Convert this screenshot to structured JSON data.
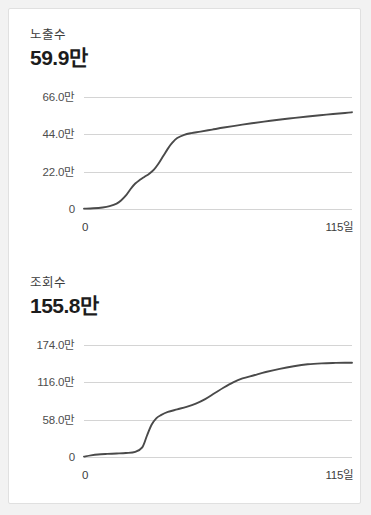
{
  "page": {
    "background_color": "#f2f2f2",
    "card_background": "#ffffff",
    "card_border_color": "#e0e0e0"
  },
  "panels": [
    {
      "metric_label": "노출수",
      "metric_value": "59.9만"
    },
    {
      "metric_label": "조회수",
      "metric_value": "155.8만"
    }
  ],
  "chart_data": [
    {
      "type": "line",
      "title": "노출수",
      "total_label": "59.9만",
      "xlabel": "",
      "ylabel": "",
      "grid": true,
      "legend": null,
      "line_color": "#4a4a4a",
      "grid_color": "#d4d4d4",
      "xlim": [
        0,
        115
      ],
      "ylim": [
        0,
        660000
      ],
      "xticks": [
        0,
        115
      ],
      "xticklabels": [
        "0",
        "115일"
      ],
      "yticks": [
        0,
        220000,
        440000,
        660000
      ],
      "yticklabels": [
        "0",
        "22.0만",
        "44.0만",
        "66.0만"
      ],
      "x": [
        0,
        4,
        8,
        11,
        14,
        16,
        18,
        20,
        22,
        24,
        26,
        28,
        30,
        32,
        34,
        36,
        38,
        40,
        43,
        46,
        50,
        55,
        60,
        66,
        72,
        80,
        88,
        96,
        104,
        112,
        115
      ],
      "y": [
        2000,
        4000,
        9000,
        17000,
        32000,
        52000,
        80000,
        118000,
        150000,
        172000,
        190000,
        208000,
        232000,
        268000,
        312000,
        356000,
        392000,
        418000,
        437000,
        447000,
        456000,
        468000,
        480000,
        493000,
        505000,
        520000,
        533000,
        545000,
        556000,
        566000,
        570000
      ]
    },
    {
      "type": "line",
      "title": "조회수",
      "total_label": "155.8만",
      "xlabel": "",
      "ylabel": "",
      "grid": true,
      "legend": null,
      "line_color": "#4a4a4a",
      "grid_color": "#d4d4d4",
      "xlim": [
        0,
        115
      ],
      "ylim": [
        0,
        1740000
      ],
      "xticks": [
        0,
        115
      ],
      "xticklabels": [
        "0",
        "115일"
      ],
      "yticks": [
        0,
        580000,
        1160000,
        1740000
      ],
      "yticklabels": [
        "0",
        "58.0만",
        "116.0만",
        "174.0만"
      ],
      "x": [
        0,
        3,
        6,
        10,
        14,
        18,
        22,
        25,
        27,
        29,
        31,
        33,
        36,
        40,
        44,
        48,
        52,
        56,
        60,
        64,
        68,
        73,
        78,
        84,
        90,
        96,
        102,
        108,
        112,
        115
      ],
      "y": [
        6000,
        26000,
        40000,
        48000,
        54000,
        62000,
        80000,
        150000,
        330000,
        500000,
        600000,
        650000,
        700000,
        740000,
        780000,
        830000,
        900000,
        990000,
        1080000,
        1160000,
        1220000,
        1270000,
        1320000,
        1370000,
        1410000,
        1440000,
        1455000,
        1462000,
        1465000,
        1465000
      ]
    }
  ]
}
